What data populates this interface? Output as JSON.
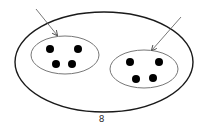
{
  "figure": {
    "label": "8",
    "colors": {
      "outer_stroke": "#1a1a1a",
      "group_stroke": "#777777",
      "dot_fill": "#000000",
      "arrow_stroke": "#555555"
    },
    "outer_ellipse": {
      "cx": 104,
      "cy": 62,
      "rx": 89,
      "ry": 50
    },
    "groups": [
      {
        "name": "left-group",
        "ellipse": {
          "cx": 65,
          "cy": 55,
          "rx": 34,
          "ry": 19
        },
        "dots": [
          [
            50,
            49
          ],
          [
            78,
            49
          ],
          [
            56,
            64
          ],
          [
            72,
            64
          ]
        ],
        "arrow": {
          "x1": 36,
          "y1": 9,
          "x2": 57,
          "y2": 35
        }
      },
      {
        "name": "right-group",
        "ellipse": {
          "cx": 144,
          "cy": 69,
          "rx": 34,
          "ry": 19
        },
        "dots": [
          [
            130,
            62
          ],
          [
            159,
            62
          ],
          [
            136,
            79
          ],
          [
            153,
            78
          ]
        ],
        "arrow": {
          "x1": 181,
          "y1": 17,
          "x2": 152,
          "y2": 50
        }
      }
    ]
  }
}
